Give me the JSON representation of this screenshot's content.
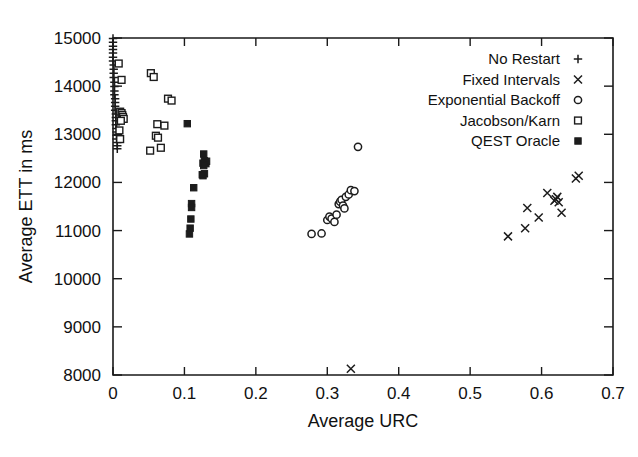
{
  "chart_data": {
    "type": "scatter",
    "title": "",
    "xlabel": "Average URC",
    "ylabel": "Average ETT in ms",
    "xlim": [
      0,
      0.7
    ],
    "ylim": [
      8000,
      15000
    ],
    "xticks": [
      "0",
      "0.1",
      "0.2",
      "0.3",
      "0.4",
      "0.5",
      "0.6",
      "0.7"
    ],
    "xtick_values": [
      0,
      0.1,
      0.2,
      0.3,
      0.4,
      0.5,
      0.6,
      0.7
    ],
    "yticks": [
      "8000",
      "9000",
      "10000",
      "11000",
      "12000",
      "13000",
      "14000",
      "15000"
    ],
    "ytick_values": [
      8000,
      9000,
      10000,
      11000,
      12000,
      13000,
      14000,
      15000
    ],
    "grid": false,
    "legend_position": "top-right",
    "series": [
      {
        "name": "No Restart",
        "marker": "plus",
        "points": [
          [
            0.0,
            14990
          ],
          [
            0.0,
            14910
          ],
          [
            0.0,
            14830
          ],
          [
            0.0,
            14760
          ],
          [
            0.0,
            14690
          ],
          [
            0.0,
            14600
          ],
          [
            0.0,
            14520
          ],
          [
            0.001,
            14440
          ],
          [
            0.001,
            14350
          ],
          [
            0.001,
            14270
          ],
          [
            0.001,
            14180
          ],
          [
            0.002,
            14080
          ],
          [
            0.002,
            13990
          ],
          [
            0.002,
            13900
          ],
          [
            0.002,
            13820
          ],
          [
            0.003,
            13740
          ],
          [
            0.003,
            13660
          ],
          [
            0.003,
            13580
          ],
          [
            0.003,
            13500
          ],
          [
            0.004,
            13420
          ],
          [
            0.004,
            13350
          ],
          [
            0.004,
            13280
          ],
          [
            0.004,
            13200
          ],
          [
            0.005,
            13120
          ],
          [
            0.005,
            13050
          ],
          [
            0.005,
            12980
          ],
          [
            0.005,
            12900
          ],
          [
            0.006,
            12830
          ],
          [
            0.006,
            12760
          ],
          [
            0.006,
            12700
          ]
        ]
      },
      {
        "name": "Fixed Intervals",
        "marker": "cross",
        "points": [
          [
            0.553,
            10880
          ],
          [
            0.577,
            11050
          ],
          [
            0.58,
            11470
          ],
          [
            0.596,
            11270
          ],
          [
            0.608,
            11780
          ],
          [
            0.618,
            11620
          ],
          [
            0.62,
            11650
          ],
          [
            0.622,
            11700
          ],
          [
            0.624,
            11590
          ],
          [
            0.628,
            11370
          ],
          [
            0.648,
            12080
          ],
          [
            0.652,
            12140
          ],
          [
            0.333,
            8130
          ]
        ]
      },
      {
        "name": "Exponential Backoff",
        "marker": "circle",
        "points": [
          [
            0.278,
            10930
          ],
          [
            0.292,
            10940
          ],
          [
            0.3,
            11220
          ],
          [
            0.303,
            11290
          ],
          [
            0.306,
            11250
          ],
          [
            0.31,
            11180
          ],
          [
            0.313,
            11330
          ],
          [
            0.316,
            11550
          ],
          [
            0.318,
            11600
          ],
          [
            0.32,
            11640
          ],
          [
            0.322,
            11520
          ],
          [
            0.324,
            11460
          ],
          [
            0.326,
            11700
          ],
          [
            0.33,
            11750
          ],
          [
            0.333,
            11840
          ],
          [
            0.338,
            11820
          ],
          [
            0.343,
            12740
          ]
        ]
      },
      {
        "name": "Jacobson/Karn",
        "marker": "square-open",
        "points": [
          [
            0.008,
            14470
          ],
          [
            0.012,
            14130
          ],
          [
            0.053,
            14270
          ],
          [
            0.057,
            14190
          ],
          [
            0.077,
            13740
          ],
          [
            0.082,
            13700
          ],
          [
            0.01,
            13470
          ],
          [
            0.012,
            13440
          ],
          [
            0.013,
            13400
          ],
          [
            0.014,
            13360
          ],
          [
            0.015,
            13320
          ],
          [
            0.011,
            13280
          ],
          [
            0.009,
            13080
          ],
          [
            0.01,
            12900
          ],
          [
            0.062,
            13210
          ],
          [
            0.06,
            12970
          ],
          [
            0.063,
            12930
          ],
          [
            0.067,
            12720
          ],
          [
            0.072,
            13180
          ],
          [
            0.052,
            12660
          ]
        ]
      },
      {
        "name": "QEST Oracle",
        "marker": "square-filled",
        "points": [
          [
            0.104,
            13220
          ],
          [
            0.127,
            12590
          ],
          [
            0.128,
            12450
          ],
          [
            0.129,
            12420
          ],
          [
            0.13,
            12390
          ],
          [
            0.131,
            12440
          ],
          [
            0.126,
            12400
          ],
          [
            0.127,
            12350
          ],
          [
            0.128,
            12180
          ],
          [
            0.126,
            12140
          ],
          [
            0.125,
            12160
          ],
          [
            0.113,
            11890
          ],
          [
            0.11,
            11560
          ],
          [
            0.11,
            11480
          ],
          [
            0.109,
            11240
          ],
          [
            0.108,
            11050
          ],
          [
            0.107,
            10930
          ]
        ]
      }
    ]
  },
  "legend": {
    "items": [
      {
        "label": "No Restart",
        "marker": "plus"
      },
      {
        "label": "Fixed Intervals",
        "marker": "cross"
      },
      {
        "label": "Exponential Backoff",
        "marker": "circle"
      },
      {
        "label": "Jacobson/Karn",
        "marker": "square-open"
      },
      {
        "label": "QEST Oracle",
        "marker": "square-filled"
      }
    ]
  },
  "colors": {
    "ink": "#1c1c1c",
    "background": "#ffffff"
  }
}
